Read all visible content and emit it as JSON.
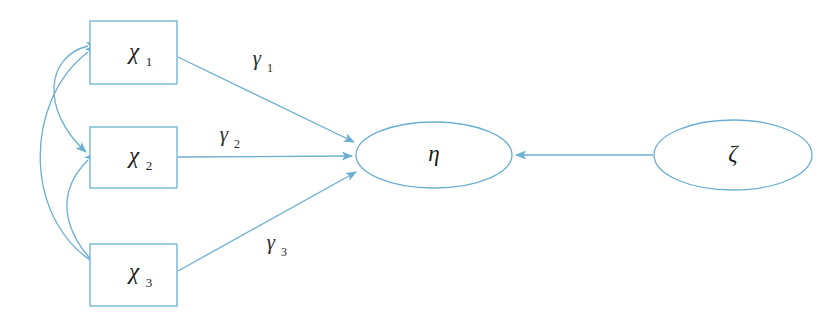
{
  "diagram": {
    "type": "structural-equation-model-path-diagram",
    "stroke_color": "#6BAFD0",
    "glyph_color": "#1a1a1a",
    "background_color": "#ffffff"
  },
  "nodes": {
    "exogenous": [
      {
        "id": "chi1",
        "symbol": "χ",
        "subscript": "1",
        "shape": "rectangle",
        "x": 90,
        "y": 21,
        "width": 87,
        "height": 63
      },
      {
        "id": "chi2",
        "symbol": "χ",
        "subscript": "2",
        "shape": "rectangle",
        "x": 90,
        "y": 127,
        "width": 87,
        "height": 61
      },
      {
        "id": "chi3",
        "symbol": "χ",
        "subscript": "3",
        "shape": "rectangle",
        "x": 90,
        "y": 244,
        "width": 87,
        "height": 62
      }
    ],
    "latent": {
      "id": "eta",
      "symbol": "η",
      "shape": "ellipse",
      "cx": 434,
      "cy": 155,
      "rx": 78,
      "ry": 33
    },
    "disturbance": {
      "id": "zeta",
      "symbol": "ζ",
      "shape": "ellipse",
      "cx": 733,
      "cy": 155,
      "rx": 79,
      "ry": 35
    }
  },
  "paths": [
    {
      "id": "gamma1",
      "from": "chi1",
      "to": "eta",
      "label": "γ",
      "subscript": "1",
      "label_x": 260,
      "label_y": 60
    },
    {
      "id": "gamma2",
      "from": "chi2",
      "to": "eta",
      "label": "γ",
      "subscript": "2",
      "label_x": 227,
      "label_y": 137
    },
    {
      "id": "gamma3",
      "from": "chi3",
      "to": "eta",
      "label": "γ",
      "subscript": "3",
      "label_x": 274,
      "label_y": 244
    }
  ],
  "covariances": [
    {
      "id": "cov-chi1-chi2",
      "between": [
        "chi1",
        "chi2"
      ]
    },
    {
      "id": "cov-chi2-chi3",
      "between": [
        "chi2",
        "chi3"
      ]
    },
    {
      "id": "cov-chi1-chi3",
      "between": [
        "chi1",
        "chi3"
      ]
    }
  ],
  "disturbance_path": {
    "id": "zeta-to-eta",
    "from": "zeta",
    "to": "eta"
  }
}
